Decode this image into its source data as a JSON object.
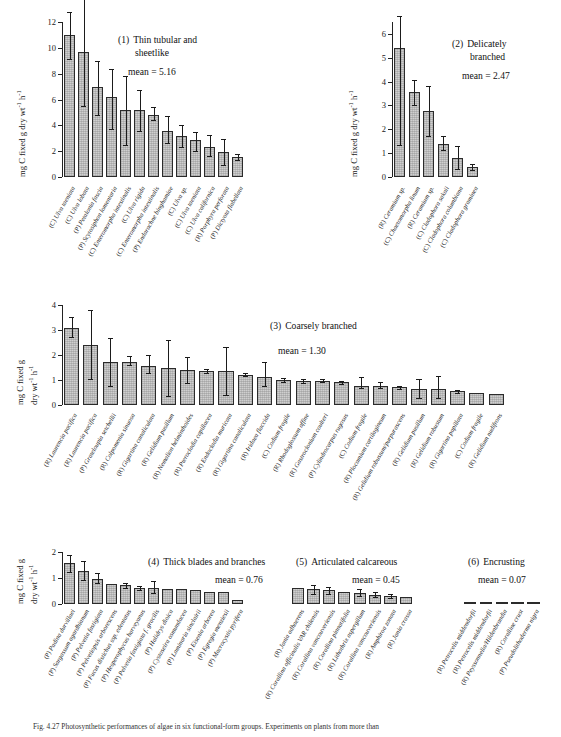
{
  "figure": {
    "caption": "Fig. 4.27  Photosynthetic performances of algae in six functional-form groups. Experiments on plants from more than",
    "y_axis_label_line1": "mg C fixed g dry wt",
    "y_axis_label_line2": "mg C fixed g",
    "y_axis_label_line2b": "dry wt",
    "y_axis_unit_sup1": "-1",
    "y_axis_unit_mid": " h",
    "y_axis_unit_sup2": "-1",
    "mean_prefix": "mean = "
  },
  "chart_data": [
    {
      "type": "bar",
      "panel_number": "(1)",
      "title": "Thin tubular and",
      "title_line2": "sheetlike",
      "mean": "5.16",
      "ylabel": "mg C fixed g dry wt-1 h-1",
      "ylim": [
        0,
        12
      ],
      "yticks": [
        0,
        2,
        4,
        6,
        8,
        10,
        12
      ],
      "ytick_labels": [
        "0",
        "2",
        "4",
        "6",
        "8",
        "10",
        "12"
      ],
      "grid": false,
      "categories": [
        "(C) Ulva taeniata",
        "(C) Ulva lobata",
        "(P) Petalonia fascia",
        "(P) Scytosiphon lomentaria",
        "(C) Enteromorpha intestinalis",
        "(C) Ulva rigida",
        "(C) Enteromorpha intestinalis",
        "(P) Endarachne binghamiae",
        "(C) Ulva sp.",
        "(C) Ulva taeniata",
        "(C) Ulva californica",
        "(R) Porphyra perforata",
        "(P) Dictyota flabellata"
      ],
      "values": [
        11.0,
        9.7,
        7.0,
        6.2,
        5.2,
        5.15,
        4.8,
        3.6,
        3.2,
        2.85,
        2.35,
        1.95,
        1.55
      ],
      "err_low": [
        9.15,
        5.5,
        4.8,
        3.75,
        2.45,
        3.55,
        4.45,
        2.6,
        2.3,
        2.05,
        1.6,
        0.95,
        1.3
      ],
      "err_high": [
        12.8,
        14.0,
        9.0,
        8.4,
        7.85,
        6.7,
        5.4,
        4.7,
        4.05,
        3.5,
        3.25,
        2.95,
        1.8
      ]
    },
    {
      "type": "bar",
      "panel_number": "(2)",
      "title": "Delicately",
      "title_line2": "branched",
      "mean": "2.47",
      "ylabel": "mg C fixed g dry wt-1 h-1",
      "ylim": [
        0,
        6.5
      ],
      "yticks": [
        0,
        1,
        2,
        3,
        4,
        5,
        6
      ],
      "ytick_labels": [
        "0",
        "1",
        "2",
        "3",
        "4",
        "5",
        "6"
      ],
      "grid": false,
      "categories": [
        "(R) Ceramium sp.",
        "(C) Chaetomorpha linum",
        "(R) Ceramium sp.",
        "(C) Cladophora sakaii",
        "(C) Cladophora columbiana",
        "(C) Cladophora graminea"
      ],
      "values": [
        5.42,
        3.58,
        2.78,
        1.4,
        0.78,
        0.42
      ],
      "err_low": [
        1.35,
        3.02,
        1.72,
        1.12,
        0.32,
        0.3
      ],
      "err_high": [
        6.75,
        4.08,
        3.82,
        1.7,
        1.3,
        0.55
      ]
    },
    {
      "type": "bar",
      "panel_number": "(3)",
      "title": "Coarsely branched",
      "title_line2": "",
      "mean": "1.30",
      "ylabel": "mg C fixed g dry wt-1 h-1",
      "ylim": [
        0,
        4
      ],
      "yticks": [
        0,
        1,
        2,
        3,
        4
      ],
      "ytick_labels": [
        "0",
        "1",
        "2",
        "3",
        "4"
      ],
      "grid": false,
      "categories": [
        "(R) Laurencia pacifica",
        "(R) Laurencia pacifica",
        "(P) Grateloupia setchellii",
        "(R) Colpomenia sinuosa",
        "(R) Gigartina canaliculata",
        "(R) Gelidium pusillum",
        "(R) Nemalion helminthoides",
        "(R) Pterocladia capillacea",
        "(R) Endocladia muricata",
        "(R) Gigartina canaliculata",
        "(R) Iridaea flaccida",
        "(C) Codium fragile",
        "(R) Rhodoglossum affine",
        "(R) Gastroclonium coulteri",
        "(P) Cylindrocarpus rugosus",
        "(C) Codium fragile",
        "(R) Plocamium cartilagineum",
        "(R) Gelidium robustum/purpurascens",
        "(R) Gelidium pusillum",
        "(R) Gelidium robustum",
        "(R) Gigartina papillata",
        "(C) Codium fragile",
        "(R) Gelidium nudifrons"
      ],
      "values": [
        3.08,
        2.4,
        1.72,
        1.72,
        1.58,
        1.48,
        1.4,
        1.38,
        1.38,
        1.22,
        1.12,
        1.0,
        0.98,
        0.98,
        0.92,
        0.78,
        0.75,
        0.72,
        0.65,
        0.63,
        0.56,
        0.48,
        0.46
      ],
      "err_low": [
        2.72,
        1.06,
        0.78,
        1.62,
        1.3,
        0.35,
        0.88,
        1.3,
        0.42,
        1.18,
        0.78,
        0.92,
        0.9,
        0.92,
        0.85,
        0.7,
        0.68,
        0.66,
        0.3,
        0.28,
        0.5,
        0.48,
        0.46
      ],
      "err_high": [
        3.52,
        3.82,
        2.68,
        1.96,
        2.02,
        2.62,
        1.92,
        1.46,
        2.32,
        1.28,
        1.72,
        1.08,
        1.06,
        1.04,
        0.98,
        1.12,
        0.92,
        0.78,
        1.05,
        1.15,
        0.62,
        0.48,
        0.46
      ]
    },
    {
      "type": "bar",
      "panel_number": "(4)",
      "title": "Thick blades and branches",
      "title_line2": "",
      "mean": "0.76",
      "ylabel": "mg C fixed g dry wt-1 h-1",
      "ylim": [
        0,
        2
      ],
      "yticks": [
        0,
        1,
        2
      ],
      "ytick_labels": [
        "0",
        "1",
        "2"
      ],
      "grid": false,
      "categories": [
        "(P) Padina durvillaei",
        "(P) Sargassum agardhianum",
        "(P) Pelvetia fastigiata",
        "(P) Pelvetiopsis arborescens",
        "(P) Fucus distichus ssp. edentatus",
        "(P) Hesperophycus harveyanus",
        "(P) Pelvetia fastigiata f. gracilis",
        "(P) Halidrys dioica",
        "(P) Cystoseira osmundacea",
        "(P) Laminaria sinclairii",
        "(P) Eisenia arborea",
        "(P) Egregia menziesii",
        "(P) Macrocystis pyrifera"
      ],
      "values": [
        1.56,
        1.26,
        0.96,
        0.76,
        0.72,
        0.62,
        0.6,
        0.58,
        0.56,
        0.52,
        0.48,
        0.46,
        0.14
      ],
      "err_low": [
        1.22,
        0.92,
        0.8,
        0.76,
        0.62,
        0.52,
        0.42,
        0.58,
        0.56,
        0.52,
        0.48,
        0.46,
        0.14
      ],
      "err_high": [
        1.9,
        1.66,
        1.18,
        0.76,
        0.82,
        0.7,
        0.9,
        0.58,
        0.56,
        0.52,
        0.48,
        0.46,
        0.14
      ]
    },
    {
      "type": "bar",
      "panel_number": "(5)",
      "title": "Articulated calcareous",
      "title_line2": "",
      "mean": "0.45",
      "ylabel": "",
      "ylim": [
        0,
        2
      ],
      "yticks": [],
      "ytick_labels": [],
      "grid": false,
      "categories": [
        "(R) Jania adhaerens",
        "(R) Corallina officinalis VAR chilensis",
        "(R) Corallina vancouveriensis",
        "(R) Corallina pinnatifolia",
        "(R) Lithothrix aspergillum",
        "(R) Corallina vancouveriensis",
        "(R) Amphiroa zonata",
        "(R) Jania crassa"
      ],
      "values": [
        0.62,
        0.56,
        0.52,
        0.46,
        0.44,
        0.36,
        0.32,
        0.26
      ],
      "err_low": [
        0.62,
        0.38,
        0.4,
        0.46,
        0.3,
        0.26,
        0.24,
        0.26
      ],
      "err_high": [
        0.62,
        0.74,
        0.64,
        0.46,
        0.58,
        0.46,
        0.4,
        0.26
      ]
    },
    {
      "type": "bar",
      "panel_number": "(6)",
      "title": "Encrusting",
      "title_line2": "",
      "mean": "0.07",
      "ylabel": "",
      "ylim": [
        0,
        2
      ],
      "yticks": [],
      "ytick_labels": [],
      "grid": false,
      "categories": [
        "(R) Petrocelis middendorfii",
        "(R) Petrocelis middendorfii",
        "(R) Peyssonnelia/Hildenbrandia",
        "(R) Coralline crust",
        "(P) Pseudolithoderma nigra"
      ],
      "values": [
        0.09,
        0.08,
        0.07,
        0.06,
        0.06
      ],
      "err_low": [
        0.09,
        0.08,
        0.07,
        0.06,
        0.06
      ],
      "err_high": [
        0.09,
        0.08,
        0.07,
        0.06,
        0.06
      ]
    }
  ]
}
